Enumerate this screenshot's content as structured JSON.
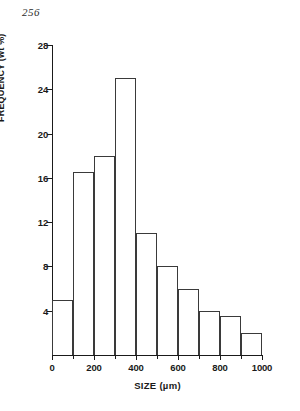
{
  "page_number": "256",
  "chart_data": {
    "type": "bar",
    "title": "",
    "xlabel": "SIZE  (µm)",
    "ylabel": "FREQUENCY  (wt %)",
    "xlim": [
      0,
      1000
    ],
    "ylim": [
      0,
      28
    ],
    "grid": false,
    "legend": null,
    "bin_width": 100,
    "categories": [
      "0-100",
      "100-200",
      "200-300",
      "300-400",
      "400-500",
      "500-600",
      "600-700",
      "700-800",
      "800-900",
      "900-1000"
    ],
    "bin_edges": [
      0,
      100,
      200,
      300,
      400,
      500,
      600,
      700,
      800,
      900,
      1000
    ],
    "values": [
      5,
      16.5,
      18,
      25,
      11,
      8,
      6,
      4,
      3.5,
      2
    ],
    "xticks": [
      0,
      200,
      400,
      600,
      800,
      1000
    ],
    "xtick_labels": [
      "0",
      "200",
      "400",
      "600",
      "800",
      "1000"
    ],
    "xticks_minor": [
      100,
      300,
      500,
      700,
      900
    ],
    "yticks": [
      4,
      8,
      12,
      16,
      20,
      24,
      28
    ],
    "ytick_labels": [
      "4",
      "8",
      "12",
      "16",
      "20",
      "24",
      "28"
    ]
  },
  "colors": {
    "ink": "#1a1a1a",
    "bar_outline": "#3a3a3a",
    "background": "#ffffff"
  }
}
